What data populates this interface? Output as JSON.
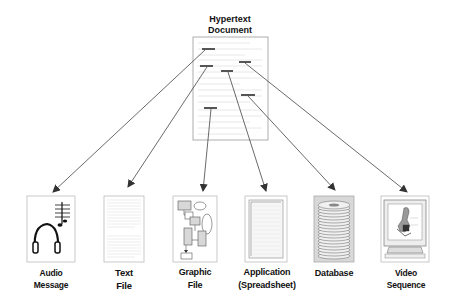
{
  "title": {
    "line1": "Hypertext",
    "line2": "Document"
  },
  "nodes": [
    {
      "id": "audio",
      "line1": "Audio",
      "line2": "Message",
      "icon": "headphones-music-icon"
    },
    {
      "id": "text",
      "line1": "Text",
      "line2": "File",
      "icon": "text-page-icon"
    },
    {
      "id": "graphic",
      "line1": "Graphic",
      "line2": "File",
      "icon": "flowchart-icon"
    },
    {
      "id": "application",
      "line1": "Application",
      "line2": "(Spreadsheet)",
      "icon": "spreadsheet-icon"
    },
    {
      "id": "database",
      "line1": "Database",
      "line2": "",
      "icon": "disk-stack-icon"
    },
    {
      "id": "video",
      "line1": "Video",
      "line2": "Sequence",
      "icon": "monitor-video-icon"
    }
  ],
  "colors": {
    "line": "#444444",
    "link": "#555555",
    "page_border": "#999999"
  }
}
